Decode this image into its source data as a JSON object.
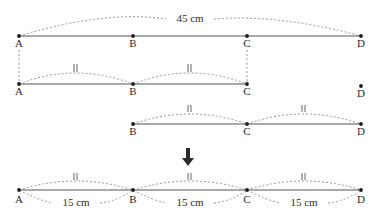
{
  "figure": {
    "title_text": "",
    "total_label": "45 cm",
    "segment_label": "15 cm",
    "arrow_icon": "down-arrow-icon",
    "points": {
      "A": "A",
      "B": "B",
      "C": "C",
      "D": "D"
    },
    "geometry": {
      "x": {
        "A": 19,
        "B": 133,
        "C": 247,
        "D": 361
      },
      "rows": {
        "row1_line_y": 36,
        "row2_line_y": 84,
        "row3_line_y": 124,
        "row4_line_y": 190
      },
      "arrow": {
        "x": 188,
        "y": 157
      }
    },
    "rows": [
      {
        "name": "row-whole-segment-AD",
        "points": [
          "A",
          "B",
          "C",
          "D"
        ],
        "brace_above": {
          "from": "A",
          "to": "D",
          "label": "45 cm"
        },
        "ticks_above": []
      },
      {
        "name": "row-segment-AC",
        "points": [
          "A",
          "B",
          "C"
        ],
        "detached_point": "D",
        "arcs_above": [
          {
            "from": "A",
            "to": "B",
            "tick": 2
          },
          {
            "from": "B",
            "to": "C",
            "tick": 2
          }
        ]
      },
      {
        "name": "row-segment-BD",
        "points": [
          "B",
          "C",
          "D"
        ],
        "arcs_above": [
          {
            "from": "B",
            "to": "C",
            "tick": 2
          },
          {
            "from": "C",
            "to": "D",
            "tick": 2
          }
        ]
      },
      {
        "name": "row-result-segment-AD",
        "points": [
          "A",
          "B",
          "C",
          "D"
        ],
        "arcs_above": [
          {
            "from": "A",
            "to": "B",
            "tick": 2
          },
          {
            "from": "B",
            "to": "C",
            "tick": 2
          },
          {
            "from": "C",
            "to": "D",
            "tick": 2
          }
        ],
        "arcs_below": [
          {
            "from": "A",
            "to": "B",
            "label": "15 cm"
          },
          {
            "from": "B",
            "to": "C",
            "label": "15 cm"
          },
          {
            "from": "C",
            "to": "D",
            "label": "15 cm"
          }
        ]
      }
    ]
  }
}
